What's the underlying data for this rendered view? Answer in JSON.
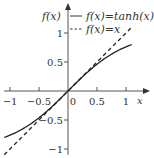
{
  "chart_data": {
    "type": "line",
    "title": "",
    "xlabel": "x",
    "ylabel": "f(x)",
    "xlim": [
      -1.1,
      1.1
    ],
    "ylim": [
      -1.1,
      1.1
    ],
    "grid": false,
    "legend_position": "top-right",
    "x_ticks": [
      -1,
      -0.5,
      0,
      0.5,
      1
    ],
    "x_tick_labels": [
      "−1",
      "−0.5",
      "0",
      "0.5",
      "1"
    ],
    "y_ticks": [
      -1,
      -0.5,
      0.5,
      1
    ],
    "y_tick_labels": [
      "−1",
      "−0.5",
      "0.5",
      "1"
    ],
    "series": [
      {
        "name": "f(x)=tanh(x)",
        "style": "solid",
        "x": [
          -1.1,
          -1.0,
          -0.8,
          -0.6,
          -0.4,
          -0.2,
          0,
          0.2,
          0.4,
          0.6,
          0.8,
          1.0,
          1.1
        ],
        "y": [
          -0.8005,
          -0.7616,
          -0.664,
          -0.537,
          -0.38,
          -0.1974,
          0,
          0.1974,
          0.38,
          0.537,
          0.664,
          0.7616,
          0.8005
        ]
      },
      {
        "name": "f(x)=x",
        "style": "dashed",
        "x": [
          -1.1,
          1.1
        ],
        "y": [
          -1.1,
          1.1
        ]
      }
    ]
  },
  "legend": {
    "solid_label": "f(x)=tanh(x)",
    "dashed_label": "f(x)=x"
  },
  "axes": {
    "x_label": "x",
    "y_label": "f(x)"
  }
}
